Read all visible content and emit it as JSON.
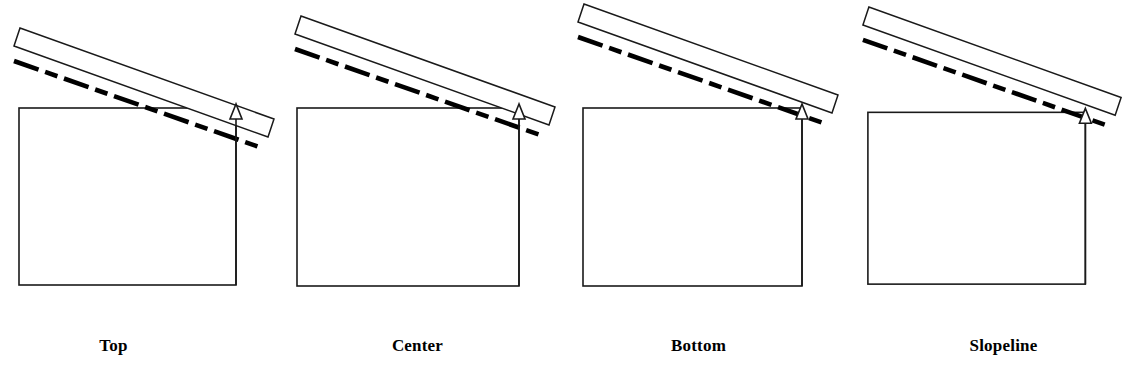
{
  "figure": {
    "background_color": "#ffffff",
    "line_color": "#000000",
    "panel_count": 4
  },
  "panels": [
    {
      "id": "top",
      "label": "Top",
      "description": "Slope line aligned to top of band",
      "wall": {
        "x": 19,
        "y": 108,
        "width": 217,
        "height": 177
      },
      "band": {
        "start_x": 14,
        "start_y": 46,
        "end_x": 268,
        "end_y": 137,
        "thickness": 26,
        "cap_offset_x": 6,
        "cap_offset_y": -18
      },
      "slopeline": {
        "start_x": 14,
        "start_y": 63,
        "end_x": 258,
        "end_y": 147,
        "style": "dashed-thick",
        "width": 4
      },
      "marker": {
        "x": 236,
        "y": 108,
        "type": "triangle-arrow"
      }
    },
    {
      "id": "center",
      "label": "Center",
      "description": "Slope line aligned to center of band",
      "wall": {
        "x": 297,
        "y": 108,
        "width": 222,
        "height": 178
      },
      "band": {
        "start_x": 295,
        "start_y": 34,
        "end_x": 549,
        "end_y": 125,
        "thickness": 26,
        "cap_offset_x": 6,
        "cap_offset_y": -18
      },
      "slopeline": {
        "start_x": 295,
        "start_y": 51,
        "end_x": 539,
        "end_y": 135,
        "style": "dashed-thick",
        "width": 4
      },
      "marker": {
        "x": 519,
        "y": 108,
        "type": "triangle-arrow"
      }
    },
    {
      "id": "bottom",
      "label": "Bottom",
      "description": "Slope line aligned to bottom of band",
      "wall": {
        "x": 583,
        "y": 108,
        "width": 219,
        "height": 178
      },
      "band": {
        "start_x": 578,
        "start_y": 22,
        "end_x": 832,
        "end_y": 113,
        "thickness": 26,
        "cap_offset_x": 6,
        "cap_offset_y": -18
      },
      "slopeline": {
        "start_x": 578,
        "start_y": 39,
        "end_x": 822,
        "end_y": 123,
        "style": "dashed-thick",
        "width": 4
      },
      "marker": {
        "x": 802,
        "y": 108,
        "type": "triangle-arrow"
      }
    },
    {
      "id": "slopeline",
      "label": "Slopeline",
      "description": "Slope line used as reference",
      "wall": {
        "x": 868,
        "y": 112,
        "width": 219,
        "height": 173
      },
      "band": {
        "start_x": 863,
        "start_y": 24,
        "end_x": 1117,
        "end_y": 115,
        "thickness": 26,
        "cap_offset_x": 6,
        "cap_offset_y": -18
      },
      "slopeline": {
        "start_x": 863,
        "start_y": 41,
        "end_x": 1107,
        "end_y": 125,
        "style": "dashed-thick",
        "width": 4
      },
      "marker": {
        "x": 1087,
        "y": 112,
        "type": "triangle-arrow"
      }
    }
  ]
}
